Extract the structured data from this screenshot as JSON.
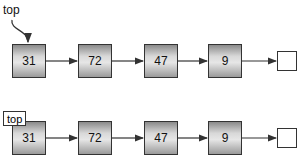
{
  "diagram_1": {
    "pointer_label": "top",
    "nodes": [
      "31",
      "72",
      "47",
      "9"
    ]
  },
  "diagram_2": {
    "pointer_label": "top",
    "nodes": [
      "31",
      "72",
      "47",
      "9"
    ]
  },
  "colors": {
    "line": "#333333",
    "node_dark": "#8a8a8a",
    "node_light": "#e6e6e6"
  }
}
